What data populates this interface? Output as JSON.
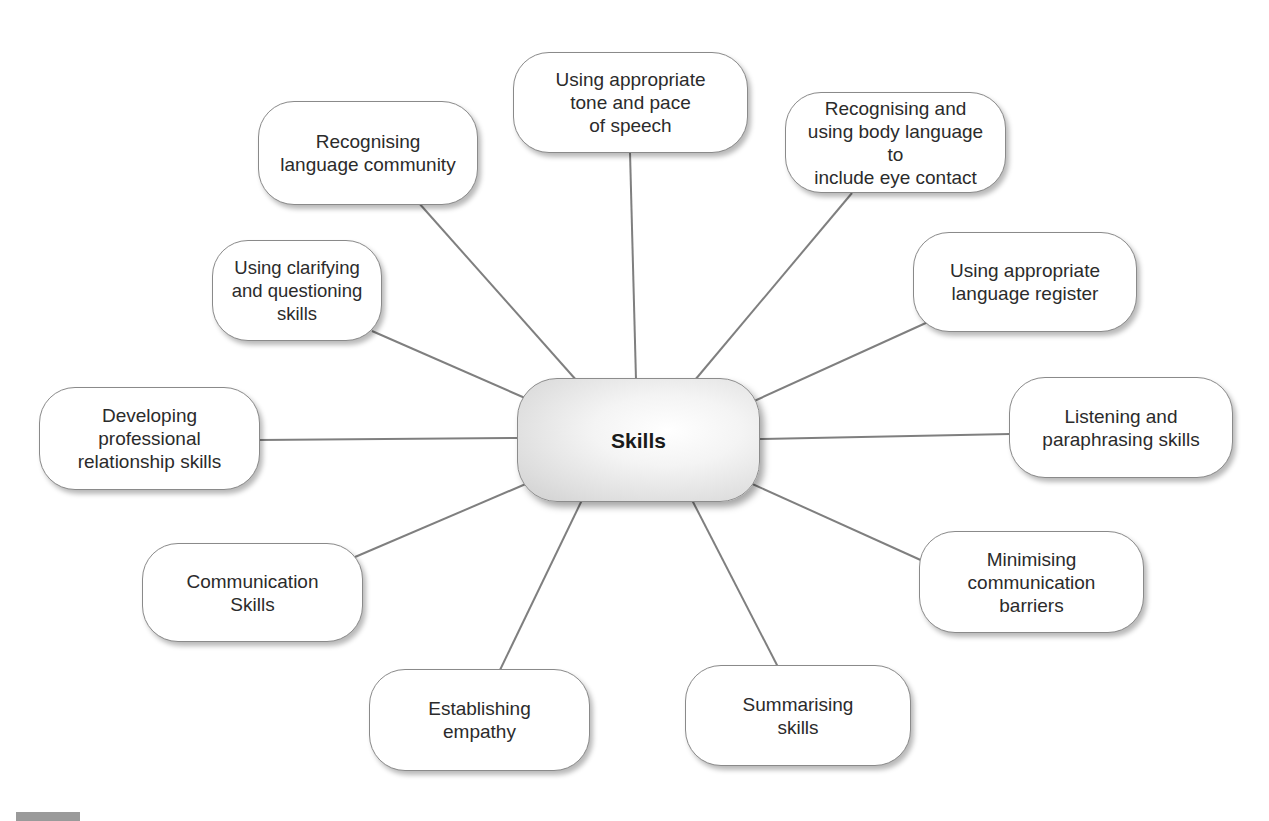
{
  "diagram": {
    "type": "mind-map",
    "center": {
      "label": "Skills"
    },
    "nodes": [
      {
        "id": "tone-pace",
        "label": "Using appropriate\ntone and pace\nof speech"
      },
      {
        "id": "body-language",
        "label": "Recognising and\nusing body language to\ninclude eye contact"
      },
      {
        "id": "language-register",
        "label": "Using appropriate\nlanguage register"
      },
      {
        "id": "listening",
        "label": "Listening and\nparaphrasing skills"
      },
      {
        "id": "minimising",
        "label": "Minimising\ncommunication\nbarriers"
      },
      {
        "id": "summarising",
        "label": "Summarising\nskills"
      },
      {
        "id": "empathy",
        "label": "Establishing\nempathy"
      },
      {
        "id": "communication",
        "label": "Communication\nSkills"
      },
      {
        "id": "professional",
        "label": "Developing\nprofessional\nrelationship skills"
      },
      {
        "id": "clarifying",
        "label": "Using clarifying\nand questioning skills"
      },
      {
        "id": "language-community",
        "label": "Recognising\nlanguage community"
      }
    ],
    "colors": {
      "line": "#7f7f7f",
      "border": "#8a8a8a",
      "text": "#2b2b2b",
      "background": "#ffffff"
    }
  }
}
